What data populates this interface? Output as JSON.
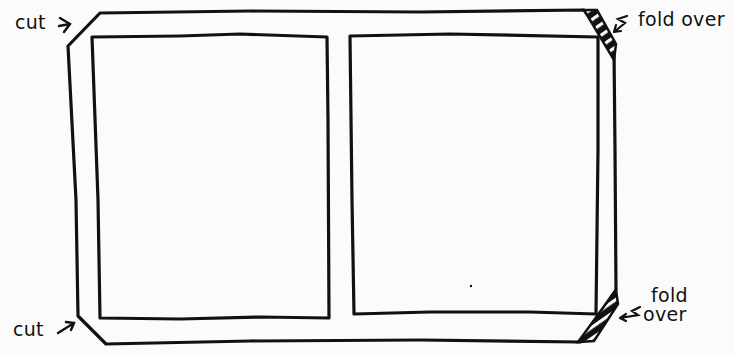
{
  "diagram": {
    "stroke_color": "#111111",
    "background_color": "#fbfbfb",
    "labels": {
      "cut_top": "cut",
      "cut_bottom": "cut",
      "fold_top": "fold over",
      "fold_bottom_line1": "fold",
      "fold_bottom_line2": "over"
    },
    "panels": [
      {
        "name": "left-panel"
      },
      {
        "name": "right-panel"
      }
    ]
  }
}
